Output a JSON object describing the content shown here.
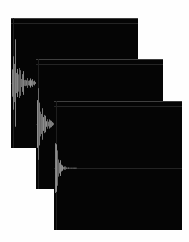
{
  "figure": {
    "background_color": "#ffffff",
    "panel_background_color": "#050505",
    "waveform_color": "#7d7d7d",
    "grid_line_color": "#272727",
    "panel_count": 3
  },
  "panels": [
    {
      "id": "panel-back",
      "label": "waveform-panel-back",
      "x": 11,
      "y": 18,
      "width": 127,
      "height": 130,
      "zoom_level": "1x",
      "time_scale_note": "most zoomed-in time axis; transient fills left third",
      "center_line_fraction": 0.5,
      "waveform": {
        "type": "audio-amplitude-envelope",
        "attack_fraction": 0.02,
        "decay_constant": 0.055,
        "max_amplitude_fraction": 0.96,
        "noise_density": 1.0,
        "samples": 260
      }
    },
    {
      "id": "panel-middle",
      "label": "waveform-panel-middle",
      "x": 36,
      "y": 59,
      "width": 127,
      "height": 130,
      "zoom_level": "2x",
      "time_scale_note": "intermediate zoom; decay visible across left quarter",
      "center_line_fraction": 0.5,
      "waveform": {
        "type": "audio-amplitude-envelope",
        "attack_fraction": 0.015,
        "decay_constant": 0.04,
        "max_amplitude_fraction": 0.95,
        "noise_density": 1.0,
        "samples": 300
      }
    },
    {
      "id": "panel-front",
      "label": "waveform-panel-front",
      "x": 54,
      "y": 101,
      "width": 128,
      "height": 129,
      "zoom_level": "4x",
      "time_scale_note": "most zoomed-out; full exponential decay tail to the right",
      "center_line_fraction": 0.52,
      "waveform": {
        "type": "audio-amplitude-envelope",
        "attack_fraction": 0.01,
        "decay_constant": 0.022,
        "max_amplitude_fraction": 0.99,
        "noise_density": 1.0,
        "samples": 420
      }
    }
  ],
  "chart_data": {
    "type": "line",
    "xlabel": "Time",
    "ylabel": "Amplitude",
    "grid": false,
    "legend_position": "none",
    "series": [
      {
        "name": "panel-back-envelope",
        "values": [
          0.05,
          0.95,
          0.72,
          0.88,
          0.55,
          0.8,
          0.62,
          0.74,
          0.48,
          0.66,
          0.52,
          0.58,
          0.4,
          0.5,
          0.34,
          0.42,
          0.28,
          0.36,
          0.22,
          0.3,
          0.18,
          0.24,
          0.14,
          0.19,
          0.11,
          0.15,
          0.08,
          0.12,
          0.06,
          0.09,
          0.05,
          0.07,
          0.04,
          0.05,
          0.03,
          0.04,
          0.02,
          0.03,
          0.02,
          0.02
        ]
      },
      {
        "name": "panel-middle-envelope",
        "values": [
          0.04,
          0.94,
          0.7,
          0.86,
          0.58,
          0.78,
          0.6,
          0.7,
          0.45,
          0.6,
          0.46,
          0.52,
          0.35,
          0.44,
          0.28,
          0.36,
          0.22,
          0.29,
          0.17,
          0.23,
          0.13,
          0.18,
          0.1,
          0.14,
          0.08,
          0.11,
          0.06,
          0.08,
          0.04,
          0.06,
          0.03,
          0.04,
          0.03,
          0.03,
          0.02,
          0.02,
          0.02,
          0.02,
          0.01,
          0.01
        ]
      },
      {
        "name": "panel-front-envelope",
        "values": [
          0.03,
          0.99,
          0.76,
          0.9,
          0.6,
          0.8,
          0.55,
          0.68,
          0.42,
          0.54,
          0.36,
          0.44,
          0.27,
          0.34,
          0.2,
          0.26,
          0.15,
          0.2,
          0.11,
          0.15,
          0.08,
          0.11,
          0.06,
          0.08,
          0.05,
          0.06,
          0.04,
          0.05,
          0.03,
          0.04,
          0.03,
          0.03,
          0.02,
          0.02,
          0.02,
          0.02,
          0.01,
          0.01,
          0.01,
          0.01
        ]
      }
    ],
    "ylim": [
      -1,
      1
    ]
  }
}
